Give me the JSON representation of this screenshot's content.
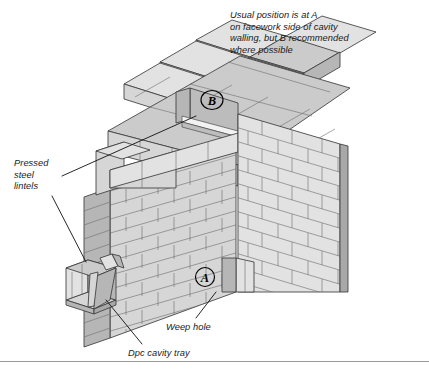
{
  "figure": {
    "type": "isometric-construction-diagram",
    "background_color": "#ffffff"
  },
  "annotations": {
    "top_note": "Usual position is at A\non facework side of cavity\nwalling, but B recommended\nwhere possible",
    "lintels_label": "Pressed\nsteel\nlintels",
    "weep_hole_label": "Weep hole",
    "dpc_label": "Dpc cavity tray"
  },
  "markers": {
    "a": "A",
    "b": "B"
  },
  "colors": {
    "brick_face": "#d6d6d6",
    "brick_face_light": "#e2e2e2",
    "brick_top": "#cccccc",
    "brick_side_dark": "#b4b4b4",
    "edge_shadow": "#a8a8a8",
    "outline": "#3c3c3c",
    "mortar_line": "#6b6b6b",
    "text": "#1a1a1a",
    "rule": "#9a9a9a",
    "lintel_fill": "#d0d0d0",
    "lintel_dark": "#b0b0b0",
    "recess_dark": "#b8b8b8"
  },
  "parts": [
    {
      "name": "block-coursing-top",
      "description": "stepped blockwork courses at top of wall"
    },
    {
      "name": "brick-outer-leaf",
      "description": "facing brickwork front elevation running bond"
    },
    {
      "name": "brick-return-wall",
      "description": "right hand return wall brick face"
    },
    {
      "name": "recess-opening-b",
      "description": "recessed opening in inner leaf containing marker B"
    },
    {
      "name": "opening-reveal",
      "description": "opening reveal at base of wall"
    },
    {
      "name": "pressed-steel-lintel",
      "description": "boot shaped pressed steel lintel section"
    },
    {
      "name": "dpc-cavity-tray",
      "description": "damp proof course cavity tray over lintel"
    },
    {
      "name": "weep-hole",
      "description": "weep hole in perpend joint"
    }
  ]
}
